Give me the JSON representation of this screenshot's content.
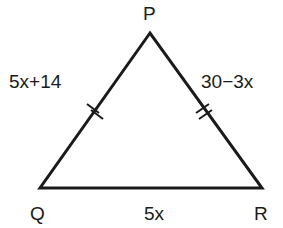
{
  "diagram": {
    "type": "isosceles-triangle",
    "vertices": {
      "P": {
        "label": "P",
        "x": 150,
        "y": 33
      },
      "Q": {
        "label": "Q",
        "x": 40,
        "y": 188
      },
      "R": {
        "label": "R",
        "x": 262,
        "y": 188
      }
    },
    "sides": {
      "PQ": {
        "label": "5x+14",
        "tick_marks": 2
      },
      "PR": {
        "label": "30−3x",
        "tick_marks": 2
      },
      "QR": {
        "label": "5x",
        "tick_marks": 0
      }
    },
    "stroke_color": "#1a1a1a",
    "background": "#ffffff"
  }
}
